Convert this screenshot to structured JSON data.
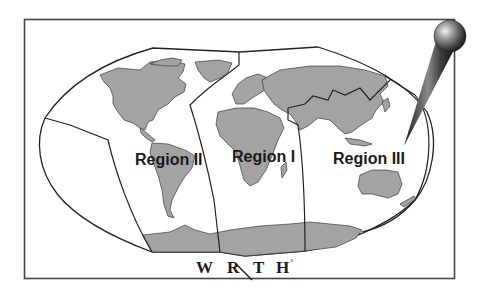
{
  "map": {
    "title": "World map with broadcasting regions",
    "regions": [
      {
        "id": "region-2",
        "label": "Region II",
        "covers": "Americas"
      },
      {
        "id": "region-1",
        "label": "Region I",
        "covers": "Europe, Africa, Middle East"
      },
      {
        "id": "region-3",
        "label": "Region III",
        "covers": "Asia, Oceania"
      }
    ],
    "colors": {
      "land": "#a3a3a3",
      "coast": "#3a3a3a",
      "boundary": "#222222",
      "frame": "#444444",
      "background": "#ffffff"
    }
  },
  "logo": {
    "letters": [
      "W",
      "R",
      "T",
      "H"
    ],
    "mark": "°"
  },
  "pin": {
    "icon": "map-pin-icon"
  }
}
